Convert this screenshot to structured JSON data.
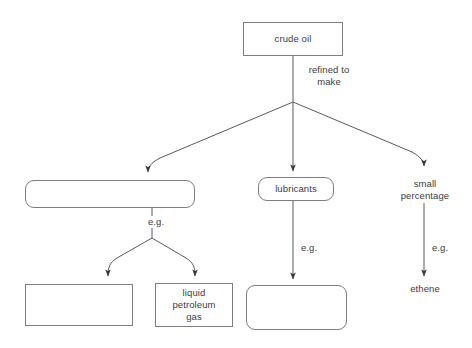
{
  "diagram": {
    "type": "flowchart",
    "background_color": "#ffffff",
    "line_color": "#5a5a5a",
    "border_color": "#7d7d7d",
    "text_color": "#3b3b3b",
    "nodes": [
      {
        "id": "crude-oil",
        "label": "crude oil",
        "shape": "rectangle",
        "blank": false
      },
      {
        "id": "fraction-left",
        "label": "",
        "shape": "rounded-rectangle",
        "blank": true
      },
      {
        "id": "lubricants",
        "label": "lubricants",
        "shape": "rounded-rectangle",
        "blank": false
      },
      {
        "id": "small-percentage",
        "label": "small\npercentage",
        "shape": "plain-text",
        "blank": false
      },
      {
        "id": "product-bottom-left",
        "label": "",
        "shape": "rectangle",
        "blank": true
      },
      {
        "id": "liquid-petroleum-gas",
        "label": "liquid\npetroleum\ngas",
        "shape": "rectangle",
        "blank": false
      },
      {
        "id": "product-bottom-middle",
        "label": "",
        "shape": "rounded-rectangle",
        "blank": true
      },
      {
        "id": "ethene",
        "label": "ethene",
        "shape": "plain-text",
        "blank": false
      }
    ],
    "edge_labels": {
      "refined_to_make": "refined to\nmake",
      "eg_left": "e.g.",
      "eg_middle": "e.g.",
      "eg_right": "e.g."
    }
  }
}
